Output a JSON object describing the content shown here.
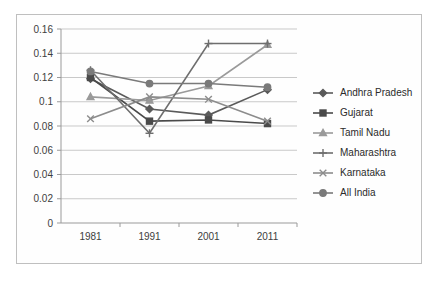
{
  "chart_data": {
    "type": "line",
    "title": "",
    "subtitle": "",
    "xlabel": "",
    "ylabel": "",
    "categories": [
      "1981",
      "1991",
      "2001",
      "2011"
    ],
    "x": [
      1981,
      1991,
      2001,
      2011
    ],
    "ylim": [
      0,
      0.16
    ],
    "yticks": [
      0,
      0.02,
      0.04,
      0.06,
      0.08,
      0.1,
      0.12,
      0.14,
      0.16
    ],
    "ytick_labels": [
      "0",
      "0.02",
      "0.04",
      "0.06",
      "0.08",
      "0.1",
      "0.12",
      "0.14",
      "0.16"
    ],
    "grid": true,
    "legend_position": "right",
    "series": [
      {
        "name": "Andhra Pradesh",
        "marker": "diamond",
        "color": "#5a5a5a",
        "values": [
          0.119,
          0.094,
          0.089,
          0.11
        ]
      },
      {
        "name": "Gujarat",
        "marker": "square",
        "color": "#4a4a4a",
        "values": [
          0.12,
          0.084,
          0.085,
          0.082
        ]
      },
      {
        "name": "Tamil Nadu",
        "marker": "triangle",
        "color": "#9a9a9a",
        "values": [
          0.104,
          0.101,
          0.113,
          0.147
        ]
      },
      {
        "name": "Maharashtra",
        "marker": "plus",
        "color": "#6e6e6e",
        "values": [
          0.126,
          0.074,
          0.148,
          0.148
        ]
      },
      {
        "name": "Karnataka",
        "marker": "cross",
        "color": "#8c8c8c",
        "values": [
          0.086,
          0.104,
          0.102,
          0.084
        ]
      },
      {
        "name": "All India",
        "marker": "circle",
        "color": "#7a7a7a",
        "values": [
          0.125,
          0.115,
          0.115,
          0.112
        ]
      }
    ]
  },
  "legend": {
    "items": [
      {
        "label": "Andhra Pradesh"
      },
      {
        "label": "Gujarat"
      },
      {
        "label": "Tamil Nadu"
      },
      {
        "label": "Maharashtra"
      },
      {
        "label": "Karnataka"
      },
      {
        "label": "All India"
      }
    ]
  }
}
